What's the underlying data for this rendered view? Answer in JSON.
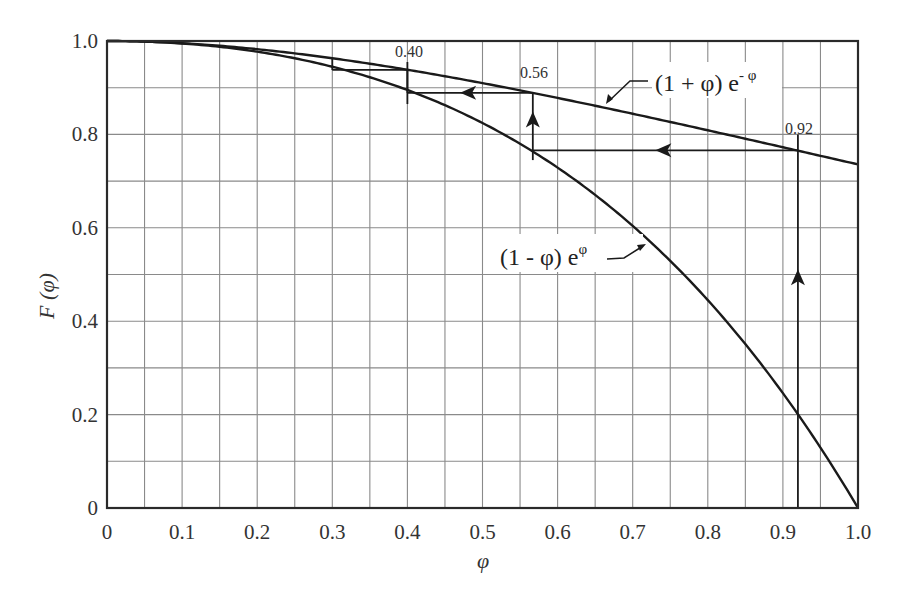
{
  "chart_data": {
    "type": "line",
    "title": "",
    "xlabel": "φ",
    "ylabel": "F (φ)",
    "xlim": [
      0,
      1.0
    ],
    "ylim": [
      0,
      1.0
    ],
    "grid": true,
    "x_ticks": [
      "0",
      "0.1",
      "0.2",
      "0.3",
      "0.4",
      "0.5",
      "0.6",
      "0.7",
      "0.8",
      "0.9",
      "1.0"
    ],
    "y_ticks": [
      "0",
      "0.2",
      "0.4",
      "0.6",
      "0.8",
      "1.0"
    ],
    "x_grid_step": 0.05,
    "y_grid_step": 0.1,
    "x": [
      0,
      0.1,
      0.2,
      0.3,
      0.4,
      0.5,
      0.6,
      0.7,
      0.8,
      0.9,
      1.0
    ],
    "series": [
      {
        "name": "(1 + φ) e^-φ",
        "label_text": "(1 + φ) e",
        "label_sup": "- φ",
        "values": [
          1.0,
          0.9953,
          0.9825,
          0.9631,
          0.9384,
          0.9098,
          0.8781,
          0.8442,
          0.8088,
          0.7725,
          0.7358
        ]
      },
      {
        "name": "(1 - φ) e^φ",
        "label_text": "(1 - φ) e",
        "label_sup": "φ",
        "values": [
          1.0,
          0.9947,
          0.9771,
          0.9449,
          0.8951,
          0.8244,
          0.7288,
          0.6041,
          0.4451,
          0.246,
          0.0
        ]
      }
    ],
    "annotations": [
      {
        "text": "0.92",
        "x": 0.92
      },
      {
        "text": "0.56",
        "x": 0.567
      },
      {
        "text": "0.40",
        "x": 0.4
      }
    ],
    "iteration_path": [
      {
        "from": [
          0.92,
          0.0
        ],
        "to": [
          0.92,
          0.766
        ],
        "direction": "up"
      },
      {
        "from": [
          0.92,
          0.766
        ],
        "to": [
          0.567,
          0.766
        ],
        "direction": "left"
      },
      {
        "from": [
          0.567,
          0.766
        ],
        "to": [
          0.567,
          0.889
        ],
        "direction": "up"
      },
      {
        "from": [
          0.567,
          0.889
        ],
        "to": [
          0.4,
          0.889
        ],
        "direction": "left"
      },
      {
        "from": [
          0.4,
          0.889
        ],
        "to": [
          0.4,
          0.938
        ],
        "direction": "up"
      },
      {
        "from": [
          0.4,
          0.938
        ],
        "to": [
          0.3,
          0.938
        ],
        "direction": "left"
      },
      {
        "from": [
          0.3,
          0.938
        ],
        "to": [
          0.3,
          0.963
        ],
        "direction": "up"
      }
    ]
  }
}
